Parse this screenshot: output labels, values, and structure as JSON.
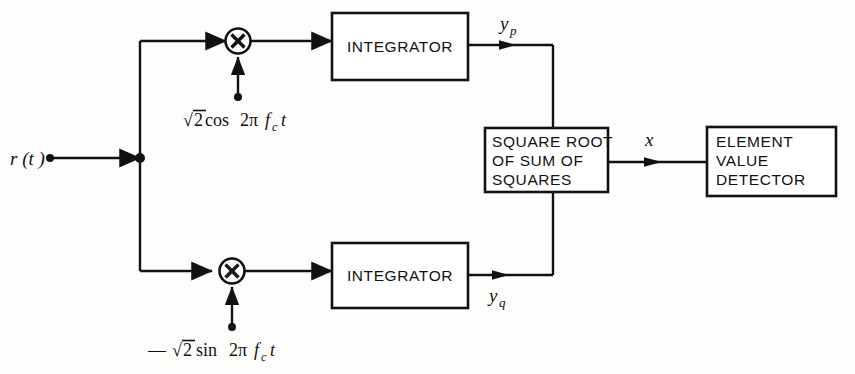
{
  "figure": {
    "type": "block-diagram",
    "background_color": "#fdfdfb",
    "line_color": "#111111"
  },
  "input": {
    "label": "r (t )",
    "label_plain": "r(t)"
  },
  "branches": {
    "upper": {
      "multiplier_symbol": "✕",
      "carrier": {
        "sign": "",
        "radical": "√",
        "radicand": "2",
        "function": "cos",
        "argument_prefix": "2π",
        "frequency": "f",
        "frequency_subscript": "c",
        "time": "t",
        "full_text": "√2cos 2π f_c t"
      },
      "block_label": "INTEGRATOR",
      "output_label": "y",
      "output_subscript": "p",
      "output_full": "y_p"
    },
    "lower": {
      "multiplier_symbol": "✕",
      "carrier": {
        "sign": "—",
        "radical": "√",
        "radicand": "2",
        "function": "sin",
        "argument_prefix": "2π",
        "frequency": "f",
        "frequency_subscript": "c",
        "time": "t",
        "full_text": "— √2sin 2π f_c t"
      },
      "block_label": "INTEGRATOR",
      "output_label": "y",
      "output_subscript": "q",
      "output_full": "y_q"
    }
  },
  "combiner": {
    "lines": [
      "SQUARE ROOT",
      "OF SUM OF",
      "SQUARES"
    ],
    "output_label": "x"
  },
  "detector": {
    "lines": [
      "ELEMENT",
      "VALUE",
      "DETECTOR"
    ]
  }
}
